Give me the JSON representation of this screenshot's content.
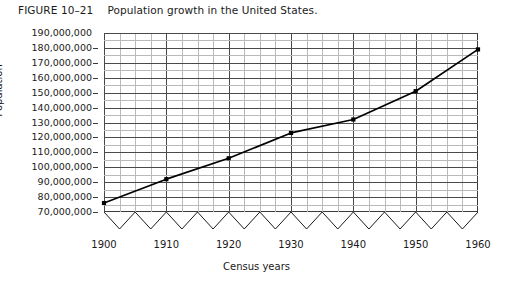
{
  "caption": {
    "figure_number": "FIGURE 10–21",
    "text": "Population growth in the United States."
  },
  "chart_data": {
    "type": "line",
    "title": "Population growth in the United States.",
    "xlabel": "Census years",
    "ylabel": "Population",
    "x": [
      1900,
      1910,
      1920,
      1930,
      1940,
      1950,
      1960
    ],
    "values": [
      76000000,
      92000000,
      106000000,
      123000000,
      132000000,
      151000000,
      179000000
    ],
    "xlim": [
      1900,
      1960
    ],
    "ylim": [
      70000000,
      190000000
    ],
    "x_tick_labels": [
      "1900",
      "1910",
      "1920",
      "1930",
      "1940",
      "1950",
      "1960"
    ],
    "y_tick_labels": [
      "190,000,000",
      "180,000,000",
      "170,000,000",
      "160,000,000",
      "150,000,000",
      "140,000,000",
      "130,000,000",
      "120,000,000",
      "110,000,000",
      "100,000,000",
      "90,000,000",
      "80,000,000",
      "70,000,000"
    ],
    "y_tick_values": [
      190000000,
      180000000,
      170000000,
      160000000,
      150000000,
      140000000,
      130000000,
      120000000,
      110000000,
      100000000,
      90000000,
      80000000,
      70000000
    ],
    "grid": true,
    "grid_minor_per_decade": 4,
    "legend": null,
    "axis_break": {
      "present": true,
      "style": "zigzag",
      "axis": "y",
      "note": "sawtooth break drawn below the 70,000,000 baseline"
    },
    "marker": "filled-square",
    "line_color": "#000000",
    "grid_major_color": "#4a4a4a",
    "grid_minor_color": "#b9b9b9",
    "frame_color": "#3a3a3a",
    "background_color": "#ffffff"
  }
}
